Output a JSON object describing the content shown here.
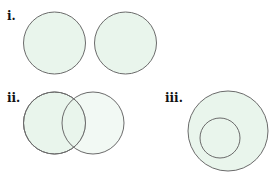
{
  "colors": {
    "fill": "#e9f5ec",
    "stroke": "#6b6b6b",
    "label": "#111111"
  },
  "diagrams": [
    {
      "label": "i.",
      "description": "two disjoint sets",
      "circles": [
        {
          "cx": 54.5,
          "cy": 43,
          "r": 31
        },
        {
          "cx": 125.5,
          "cy": 43,
          "r": 31
        }
      ]
    },
    {
      "label": "ii.",
      "description": "two overlapping sets",
      "circles": [
        {
          "cx": 54.5,
          "cy": 123,
          "r": 31
        },
        {
          "cx": 93,
          "cy": 123,
          "r": 31
        }
      ]
    },
    {
      "label": "iii.",
      "description": "subset contained within a set",
      "circles": [
        {
          "cx": 228,
          "cy": 131,
          "r": 40
        },
        {
          "cx": 220,
          "cy": 138,
          "r": 20
        }
      ]
    }
  ]
}
